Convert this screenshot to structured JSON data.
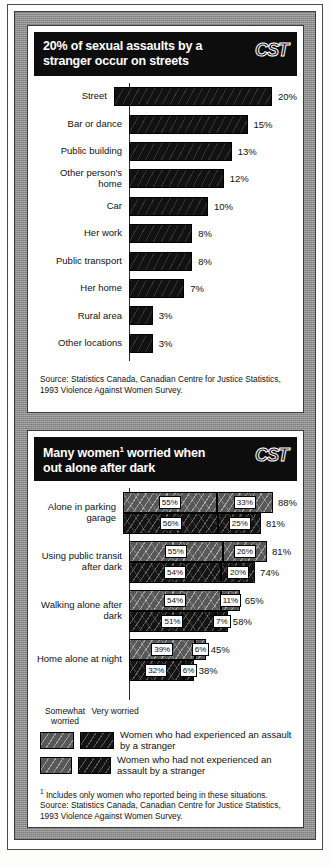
{
  "brand": {
    "logo": "CST"
  },
  "chart_data": [
    {
      "type": "bar",
      "title": "20% of sexual assaults by a stranger occur on streets",
      "xlabel": "",
      "ylabel": "",
      "xlim": [
        0,
        20
      ],
      "grid": false,
      "legend": "none",
      "categories": [
        "Street",
        "Bar or dance",
        "Public building",
        "Other person's home",
        "Car",
        "Her work",
        "Public transport",
        "Her home",
        "Rural area",
        "Other locations"
      ],
      "values": [
        20,
        15,
        13,
        12,
        10,
        8,
        8,
        7,
        3,
        3
      ],
      "value_labels": [
        "20%",
        "15%",
        "13%",
        "12%",
        "10%",
        "8%",
        "8%",
        "7%",
        "3%",
        "3%"
      ],
      "source": "Source: Statistics Canada, Canadian Centre for Justice Statistics, 1993 Violence Against Women Survey."
    },
    {
      "type": "bar",
      "subtype": "stacked-grouped",
      "title_line1": "Many women",
      "title_sup": "1",
      "title_line1_rest": " worried when",
      "title_line2": "out alone after dark",
      "xlabel": "",
      "ylabel": "",
      "xlim": [
        0,
        88
      ],
      "grid": false,
      "legend_position": "below-plot",
      "segment_names": [
        "Somewhat worried",
        "Very worried"
      ],
      "series_names": [
        "Women who had experienced an assault by a stranger",
        "Women who had not experienced an assault by a stranger"
      ],
      "categories": [
        "Alone in parking garage",
        "Using public transit after dark",
        "Walking alone after dark",
        "Home alone at night"
      ],
      "groups": [
        {
          "category": "Alone in parking garage",
          "rows": [
            {
              "series": "experienced",
              "somewhat": 55,
              "very": 33,
              "total": 88,
              "somewhat_label": "55%",
              "very_label": "33%",
              "total_label": "88%"
            },
            {
              "series": "not-experienced",
              "somewhat": 56,
              "very": 25,
              "total": 81,
              "somewhat_label": "56%",
              "very_label": "25%",
              "total_label": "81%"
            }
          ]
        },
        {
          "category": "Using public transit after dark",
          "rows": [
            {
              "series": "experienced",
              "somewhat": 55,
              "very": 26,
              "total": 81,
              "somewhat_label": "55%",
              "very_label": "26%",
              "total_label": "81%"
            },
            {
              "series": "not-experienced",
              "somewhat": 54,
              "very": 20,
              "total": 74,
              "somewhat_label": "54%",
              "very_label": "20%",
              "total_label": "74%"
            }
          ]
        },
        {
          "category": "Walking alone after dark",
          "rows": [
            {
              "series": "experienced",
              "somewhat": 54,
              "very": 11,
              "total": 65,
              "somewhat_label": "54%",
              "very_label": "11%",
              "total_label": "65%"
            },
            {
              "series": "not-experienced",
              "somewhat": 51,
              "very": 7,
              "total": 58,
              "somewhat_label": "51%",
              "very_label": "7%",
              "total_label": "58%"
            }
          ]
        },
        {
          "category": "Home alone at night",
          "rows": [
            {
              "series": "experienced",
              "somewhat": 39,
              "very": 6,
              "total": 45,
              "somewhat_label": "39%",
              "very_label": "6%",
              "total_label": "45%"
            },
            {
              "series": "not-experienced",
              "somewhat": 32,
              "very": 6,
              "total": 38,
              "somewhat_label": "32%",
              "very_label": "6%",
              "total_label": "38%"
            }
          ]
        }
      ],
      "footnote_marker": "1",
      "footnote": " Includes only women who reported being in these situations.",
      "source": "Source: Statistics Canada, Canadian Centre for Justice Statistics, 1993 Violence Against Women Survey."
    }
  ],
  "colors": {
    "title_bar": "#0d0d0d",
    "bar_fill": "#111111",
    "experienced_fill": "#585858",
    "not_experienced_fill": "#141414",
    "frame": "#9c9c9c",
    "page": "#ffffff"
  }
}
